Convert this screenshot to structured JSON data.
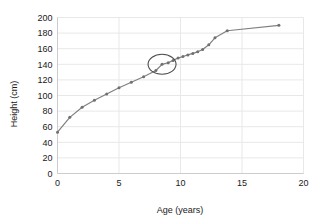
{
  "chart_data": {
    "type": "line",
    "title": "",
    "xlabel": "Age (years)",
    "ylabel": "Height (cm)",
    "xlim": [
      0,
      20
    ],
    "ylim": [
      0,
      200
    ],
    "xticks": [
      0,
      5,
      10,
      15,
      20
    ],
    "yticks": [
      0,
      20,
      40,
      60,
      80,
      100,
      120,
      140,
      160,
      180,
      200
    ],
    "xtick_labels": [
      "0",
      "5",
      "10",
      "15",
      "20"
    ],
    "ytick_labels": [
      "0",
      "20",
      "40",
      "60",
      "80",
      "100",
      "120",
      "140",
      "160",
      "180",
      "200"
    ],
    "grid": true,
    "legend": null,
    "series": [
      {
        "name": "Height",
        "marker": "circle",
        "color": "#808080",
        "x": [
          0,
          1,
          2,
          3,
          4,
          5,
          6,
          7,
          8,
          8.5,
          9,
          9.4,
          9.8,
          10.2,
          10.6,
          11,
          11.4,
          11.8,
          12.3,
          12.8,
          13.8,
          18
        ],
        "y": [
          53,
          72,
          85,
          94,
          102,
          110,
          117,
          124,
          132,
          140,
          142,
          145,
          148,
          150,
          152,
          154,
          156,
          159,
          165,
          174,
          183,
          190
        ]
      }
    ],
    "annotations": [
      {
        "type": "ellipse-highlight",
        "label": "circled-data-point",
        "x": 8.5,
        "y": 140,
        "rx_px": 14,
        "ry_px": 10,
        "color": "#4d4d4d"
      }
    ],
    "colors": {
      "line": "#808080",
      "marker": "#707070",
      "grid": "#e8e8e8",
      "axis": "#cccccc",
      "text": "#1a1a1a",
      "annotation": "#4d4d4d",
      "background": "#ffffff"
    }
  }
}
